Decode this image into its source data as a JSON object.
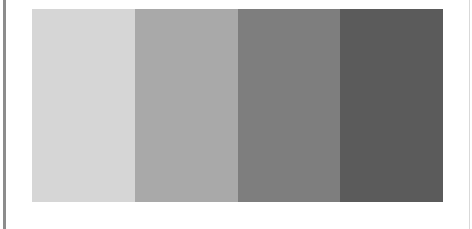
{
  "swatches": [
    {
      "name": "light-gray",
      "color": "#d6d6d6"
    },
    {
      "name": "medium-light-gray",
      "color": "#a9a9a9"
    },
    {
      "name": "medium-dark-gray",
      "color": "#7e7e7e"
    },
    {
      "name": "dark-gray",
      "color": "#5b5b5b"
    }
  ]
}
